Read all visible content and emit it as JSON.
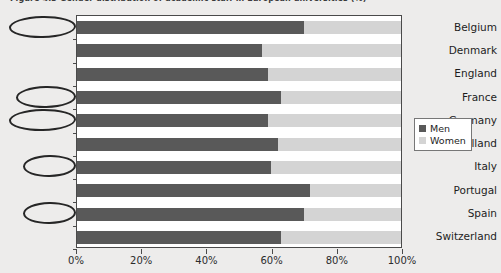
{
  "figure": {
    "title": "Figure 4.3  Gender distribution of academic staff in European universities (%)"
  },
  "legend": {
    "position": "right",
    "items": [
      {
        "label": "Men",
        "color": "#595959"
      },
      {
        "label": "Women",
        "color": "#d4d4d4"
      }
    ]
  },
  "axis": {
    "x_ticks": [
      "0%",
      "20%",
      "40%",
      "60%",
      "80%",
      "100%"
    ],
    "x_tick_values": [
      0,
      20,
      40,
      60,
      80,
      100
    ]
  },
  "annotations": {
    "circled_countries": [
      "Belgium",
      "France",
      "Germany",
      "Italy",
      "Spain"
    ]
  },
  "chart_data": {
    "type": "bar",
    "orientation": "horizontal",
    "stacked": true,
    "stacked_percent": true,
    "title": "Figure 4.3  Gender distribution of academic staff in European universities (%)",
    "xlabel": "",
    "ylabel": "",
    "xlim": [
      0,
      100
    ],
    "grid": false,
    "legend_position": "right",
    "categories": [
      "Belgium",
      "Denmark",
      "England",
      "France",
      "Germany",
      "Holland",
      "Italy",
      "Portugal",
      "Spain",
      "Switzerland"
    ],
    "series": [
      {
        "name": "Men",
        "color": "#595959",
        "values": [
          70,
          57,
          59,
          63,
          59,
          62,
          60,
          72,
          70,
          63
        ]
      },
      {
        "name": "Women",
        "color": "#d4d4d4",
        "values": [
          30,
          43,
          41,
          37,
          41,
          38,
          40,
          28,
          30,
          37
        ]
      }
    ]
  }
}
